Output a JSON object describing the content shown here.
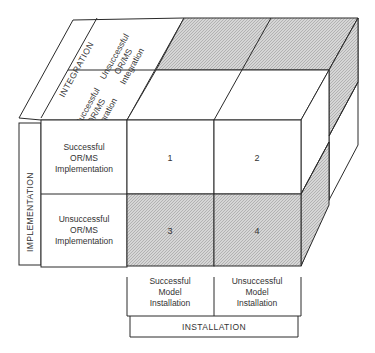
{
  "diagram": {
    "colors": {
      "line": "#2a2a2a",
      "shade": "#c9c9c9",
      "background": "#ffffff"
    },
    "integration": {
      "axis_label": "INTEGRATION",
      "rows": [
        {
          "line1": "Unsuccessful",
          "line2": "OR/MS",
          "line3": "Integration"
        },
        {
          "line1": "Successful",
          "line2": "OR/MS",
          "line3": "Integration"
        }
      ]
    },
    "implementation": {
      "axis_label": "IMPLEMENTATION",
      "rows": [
        {
          "line1": "Successful",
          "line2": "OR/MS",
          "line3": "Implementation"
        },
        {
          "line1": "Unsuccessful",
          "line2": "OR/MS",
          "line3": "Implementation"
        }
      ]
    },
    "installation": {
      "axis_label": "INSTALLATION",
      "columns": [
        {
          "line1": "Successful",
          "line2": "Model",
          "line3": "Installation"
        },
        {
          "line1": "Unsuccessful",
          "line2": "Model",
          "line3": "Installation"
        }
      ]
    },
    "cells": [
      {
        "label": "1",
        "shaded": false
      },
      {
        "label": "2",
        "shaded": false
      },
      {
        "label": "3",
        "shaded": true
      },
      {
        "label": "4",
        "shaded": true
      }
    ]
  }
}
